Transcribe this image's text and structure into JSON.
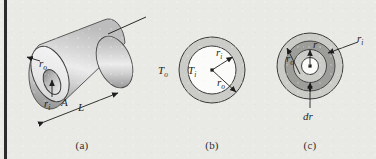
{
  "figure": {
    "background_color": "#e9e9e5",
    "rule_color": "#2b2b2b",
    "line_color": "#1d1d1d",
    "shade_light": "#dedede",
    "shade_mid": "#c6c6c6",
    "shade_dark": "#9a9a9a",
    "white": "#fbfbfb"
  },
  "panels": [
    {
      "id": "a",
      "caption": "(a)",
      "description": "isometric hollow cylinder",
      "labels": {
        "outer_radius": "r",
        "outer_radius_sub": "o",
        "inner_radius": "r",
        "inner_radius_sub": "i",
        "area": "A",
        "length": "L"
      }
    },
    {
      "id": "b",
      "caption": "(b)",
      "description": "cross section with inner and outer temperatures",
      "labels": {
        "outer_temp": "T",
        "outer_temp_sub": "o",
        "inner_temp": "T",
        "inner_temp_sub": "i",
        "inner_radius": "r",
        "inner_radius_sub": "i",
        "outer_radius": "r",
        "outer_radius_sub": "o"
      }
    },
    {
      "id": "c",
      "caption": "(c)",
      "description": "cross section with differential ring element",
      "labels": {
        "outer_radius": "r",
        "outer_radius_sub": "o",
        "radius": "r",
        "inner_radius": "r",
        "inner_radius_sub": "i",
        "thickness": "dr"
      }
    }
  ]
}
